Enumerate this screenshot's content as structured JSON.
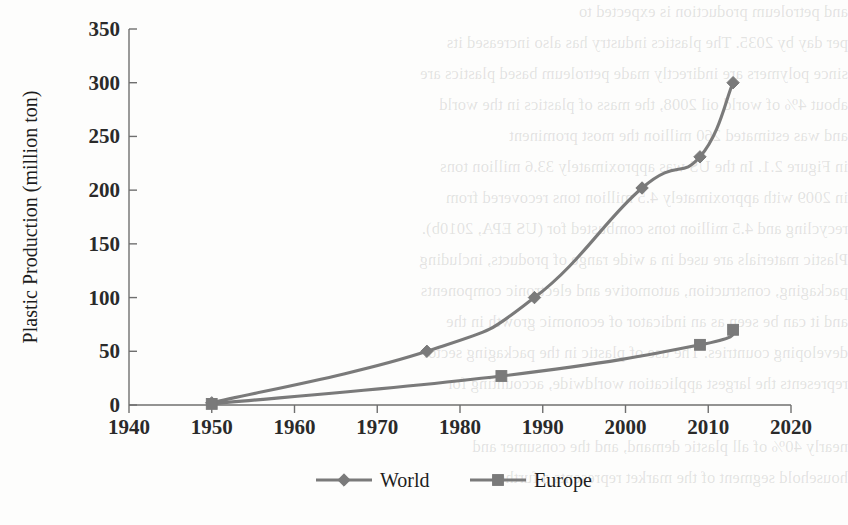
{
  "chart_data": {
    "type": "line",
    "title": "",
    "xlabel": "",
    "ylabel": "Plastic Production (million ton)",
    "xlim": [
      1940,
      2020
    ],
    "ylim": [
      0,
      350
    ],
    "xticks": [
      1940,
      1950,
      1960,
      1970,
      1980,
      1990,
      2000,
      2010,
      2020
    ],
    "yticks": [
      0,
      50,
      100,
      150,
      200,
      250,
      300,
      350
    ],
    "grid": false,
    "legend_position": "bottom-center",
    "series": [
      {
        "name": "World",
        "marker": "diamond",
        "color": "#7a7a7a",
        "x": [
          1950,
          1976,
          1989,
          2002,
          2009,
          2013
        ],
        "values": [
          2,
          50,
          100,
          202,
          231,
          300
        ]
      },
      {
        "name": "Europe",
        "marker": "square",
        "color": "#7a7a7a",
        "x": [
          1950,
          1985,
          2009,
          2013
        ],
        "values": [
          1,
          27,
          56,
          70
        ]
      }
    ]
  },
  "axes": {
    "y_label": "Plastic Production (million ton)",
    "y_tick_labels": [
      "350",
      "300",
      "250",
      "200",
      "150",
      "100",
      "50",
      "0"
    ],
    "x_tick_labels": [
      "1940",
      "1950",
      "1960",
      "1970",
      "1980",
      "1990",
      "2000",
      "2010",
      "2020"
    ]
  },
  "legend": {
    "items": [
      {
        "label": "World",
        "marker": "diamond-marker"
      },
      {
        "label": "Europe",
        "marker": "square-marker"
      }
    ]
  },
  "background_text": {
    "lines": [
      "and petroleum production is expected to",
      "per day by 2035. The plastics industry has also increased its",
      "since polymers are indirectly made petroleum based plastics are",
      "about 4% of world oil 2008, the mass of plastics in the world",
      "and was estimated 260 million the most prominent",
      "in Figure 2.1. In the US was approximately 33.6 million tons",
      "in 2009 with approximately 4.5 million tons recovered from",
      "recycling and 4.5 million tons combusted for (US EPA, 2010b).",
      "Plastic materials are used in a wide range of products, including",
      "packaging, construction, automotive and electronic components",
      "and it can be seen as an indicator of economic growth in the",
      "developing countries. The use of plastic in the packaging sector",
      "represents the largest application worldwide, accounting for",
      "nearly 40% of all plastic demand, and the consumer and",
      "household segment of the market represents a further"
    ]
  }
}
